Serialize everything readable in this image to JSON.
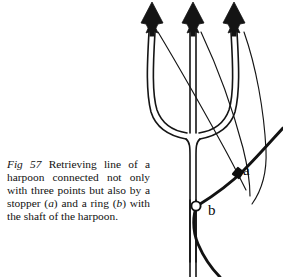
{
  "figure": {
    "number": "Fig 57",
    "caption_prefix": "Fig 57",
    "caption_text": "Retrieving line of a harpoon connected not only with three points but also by a stopper (a) and a ring (b) with the shaft of the harpoon.",
    "caption_segments": {
      "s1": "Retrieving line of a harpoon connected not only with three points but also by a stopper (",
      "a_mark": "a",
      "s2": ") and a ring (",
      "b_mark": "b",
      "s3": ") with the shaft of the harpoon."
    },
    "labels": {
      "stopper": "a",
      "ring": "b"
    },
    "parts": {
      "points_count": 3,
      "point_name": "barbed harpoon point",
      "shaft_name": "harpoon shaft",
      "stopper_name": "stopper",
      "ring_name": "ring",
      "retrieving_line_name": "retrieving line"
    },
    "colors": {
      "ink": "#0a0a0a",
      "paper": "#ffffff",
      "line": "#151515"
    }
  }
}
